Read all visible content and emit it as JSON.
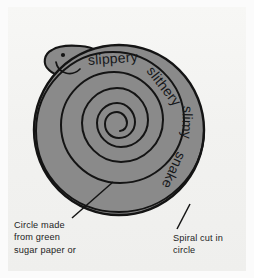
{
  "illustration": {
    "title": "Spiral snake craft diagram",
    "subject": "snake",
    "colors": {
      "body_fill": "#8a8a8a",
      "outline": "#141414",
      "paper": "#f3f3f1",
      "text": "#1d1d1d",
      "page_background": "#fbfbfb"
    }
  },
  "spiral_words": [
    {
      "text": "slippery",
      "rotation_deg": -4,
      "x": 88,
      "y": 52
    },
    {
      "text": "slithery",
      "rotation_deg": 52,
      "x": 150,
      "y": 60
    },
    {
      "text": "slimy",
      "rotation_deg": 92,
      "x": 188,
      "y": 98
    },
    {
      "text": "snake",
      "rotation_deg": 115,
      "x": 182,
      "y": 145
    }
  ],
  "captions": {
    "left": "Circle made\nfrom green\nsugar paper or",
    "right": "Spiral cut in\ncircle"
  },
  "leaders": {
    "left": {
      "from_x": 113,
      "from_y": 182,
      "to_x": 72,
      "to_y": 218
    },
    "right": {
      "from_x": 190,
      "from_y": 204,
      "to_x": 177,
      "to_y": 229
    }
  },
  "geometry": {
    "circle_center_x": 119,
    "circle_center_y": 130,
    "circle_radius": 85,
    "head_eye_x": 63,
    "head_eye_y": 55
  }
}
